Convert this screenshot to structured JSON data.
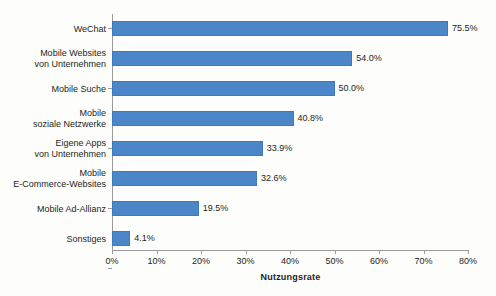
{
  "chart_data": {
    "type": "bar",
    "orientation": "horizontal",
    "title": "",
    "xlabel": "Nutzungsrate",
    "ylabel": "",
    "xlim": [
      0,
      80
    ],
    "grid": false,
    "legend": "none",
    "bar_color": "#4a86c8",
    "categories": [
      "WeChat",
      "Mobile Websites von Unternehmen",
      "Mobile Suche",
      "Mobile soziale Netzwerke",
      "Eigene Apps von Unternehmen",
      "Mobile E-Commerce-Websites",
      "Mobile Ad-Allianz",
      "Sonstiges"
    ],
    "category_lines": [
      [
        "WeChat"
      ],
      [
        "Mobile Websites",
        "von Unternehmen"
      ],
      [
        "Mobile Suche"
      ],
      [
        "Mobile",
        "soziale Netzwerke"
      ],
      [
        "Eigene Apps",
        "von Unternehmen"
      ],
      [
        "Mobile",
        "E-Commerce-Websites"
      ],
      [
        "Mobile Ad-Allianz"
      ],
      [
        "Sonstiges"
      ]
    ],
    "values": [
      75.5,
      54.0,
      50.0,
      40.8,
      33.9,
      32.6,
      19.5,
      4.1
    ],
    "value_labels": [
      "75.5%",
      "54.0%",
      "50.0%",
      "40.8%",
      "33.9%",
      "32.6%",
      "19.5%",
      "4.1%"
    ],
    "xticks": [
      0,
      10,
      20,
      30,
      40,
      50,
      60,
      70,
      80
    ],
    "xtick_labels": [
      "0%",
      "10%",
      "20%",
      "30%",
      "40%",
      "50%",
      "60%",
      "70%",
      "80%"
    ]
  }
}
